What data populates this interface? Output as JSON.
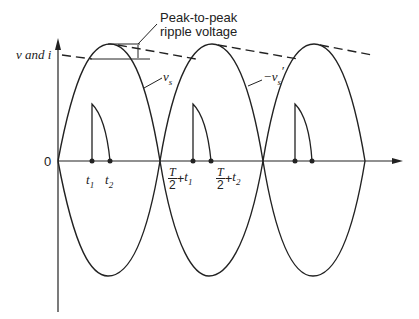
{
  "figure": {
    "y_axis_label": "v and i",
    "origin_label": "0",
    "annotation": {
      "line1": "Peak-to-peak",
      "line2": "ripple voltage"
    },
    "curve_labels": {
      "vs": "v",
      "vs_sub": "s",
      "vs_neg": "−v",
      "vs_neg_sub": "s",
      "vs_neg_prime": "′"
    },
    "time_labels": [
      {
        "id": "t1",
        "var": "t",
        "sub": "1"
      },
      {
        "id": "t2",
        "var": "t",
        "sub": "2"
      },
      {
        "id": "T2t1",
        "num": "T",
        "den": "2",
        "plus": "+",
        "var": "t",
        "sub": "1"
      },
      {
        "id": "T2t2",
        "num": "T",
        "den": "2",
        "plus": "+",
        "var": "t",
        "sub": "2"
      }
    ],
    "colors": {
      "stroke": "#222222",
      "background": "#ffffff"
    }
  }
}
